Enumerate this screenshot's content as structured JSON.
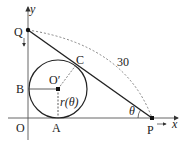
{
  "diagram": {
    "axes": {
      "x_label": "x",
      "y_label": "y",
      "origin_label": "O"
    },
    "points": {
      "Q": "Q",
      "P": "P",
      "C": "C",
      "B": "B",
      "A": "A",
      "O_prime": "O′"
    },
    "segment_length_label": "30",
    "angle_label": "θ",
    "radius_label": "r(θ)"
  }
}
